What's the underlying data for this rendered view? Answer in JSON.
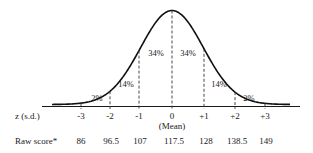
{
  "chart_data": {
    "type": "area",
    "title": "",
    "xlabel": "z (s.d.)",
    "secondary_xlabel": "Raw score*",
    "mean_label": "(Mean)",
    "z_ticks": [
      "-3",
      "-2",
      "-1",
      "0",
      "+1",
      "+2",
      "+3"
    ],
    "raw_scores": [
      "86",
      "96.5",
      "107",
      "117.5",
      "128",
      "138.5",
      "149"
    ],
    "bands": [
      {
        "range": "-3 to -2",
        "label": "2%",
        "value": 2
      },
      {
        "range": "-2 to -1",
        "label": "14%",
        "value": 14
      },
      {
        "range": "-1 to 0",
        "label": "34%",
        "value": 34
      },
      {
        "range": "0 to +1",
        "label": "34%",
        "value": 34
      },
      {
        "range": "+1 to +2",
        "label": "14%",
        "value": 14
      },
      {
        "range": "+2 to +3",
        "label": "2%",
        "value": 2
      }
    ],
    "x_range": [
      -4,
      4
    ],
    "grid": false,
    "legend": "none"
  },
  "labels": {
    "z_axis": "z (s.d.)",
    "raw_axis": "Raw score*",
    "mean": "(Mean)"
  }
}
